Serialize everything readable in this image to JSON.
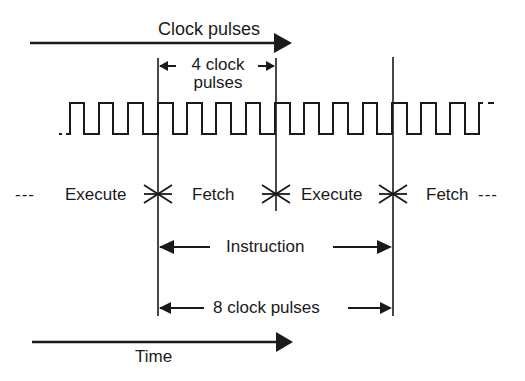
{
  "diagram": {
    "type": "timing-diagram",
    "top_arrow_label": "Clock pulses",
    "four_pulses_label_line1": "4 clock",
    "four_pulses_label_line2": "pulses",
    "phases": {
      "left_dashes": "---",
      "execute_1": "Execute",
      "fetch_1": "Fetch",
      "execute_2": "Execute",
      "fetch_2": "Fetch",
      "right_dashes": "---"
    },
    "instruction_label": "Instruction",
    "eight_pulses_label": "8 clock pulses",
    "time_label": "Time",
    "clock": {
      "period_px": 29.3,
      "cycles_per_phase": 4,
      "cycles_per_instruction": 8
    },
    "colors": {
      "ink": "#1a1a1a",
      "background": "#ffffff"
    }
  }
}
